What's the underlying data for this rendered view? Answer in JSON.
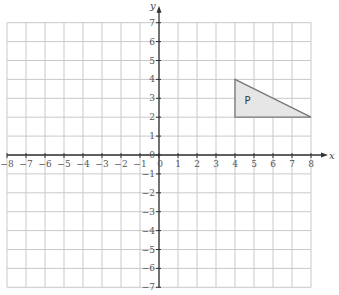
{
  "diagram": {
    "x_axis": {
      "label": "x",
      "min": -8,
      "max": 8
    },
    "y_axis": {
      "label": "y",
      "min": -7,
      "max": 7
    },
    "x_ticks": [
      "-8",
      "-7",
      "-6",
      "-5",
      "-4",
      "-3",
      "-2",
      "-1",
      "0",
      "1",
      "2",
      "3",
      "4",
      "5",
      "6",
      "7",
      "8"
    ],
    "y_ticks": [
      "7",
      "6",
      "5",
      "4",
      "3",
      "2",
      "1",
      "0",
      "-1",
      "-2",
      "-3",
      "-4",
      "-5",
      "-6",
      "-7"
    ],
    "shape": {
      "label": "P",
      "vertices": [
        [
          4,
          4
        ],
        [
          4,
          2
        ],
        [
          8,
          2
        ]
      ],
      "fill": "#e6e6e6",
      "stroke": "#777777"
    },
    "colors": {
      "grid": "#c9c9c9",
      "axis": "#333333"
    }
  }
}
